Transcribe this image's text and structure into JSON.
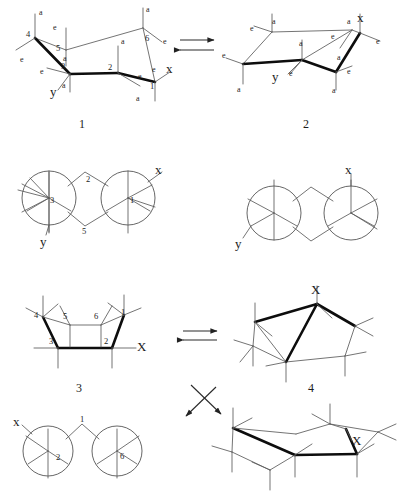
{
  "figure": {
    "background": "#ffffff",
    "ink": "#1c1c1c",
    "bold_bond_color": "#000000",
    "thin_bond_color": "#555555"
  },
  "captions": {
    "structure_1": "1",
    "structure_2": "2",
    "structure_3": "3",
    "structure_4": "4"
  },
  "arrows": {
    "equilibrium_top": "⇌",
    "equilibrium_middle": "⇌",
    "equilibrium_diagonal": "⇌"
  },
  "structure_1": {
    "caption": "1",
    "type": "chair-conformation",
    "ring_numbers": [
      "4",
      "5",
      "3",
      "2",
      "6",
      "1"
    ],
    "substituent_labels": [
      {
        "text": "a",
        "x": 39,
        "y": 9
      },
      {
        "text": "e",
        "x": 53,
        "y": 24
      },
      {
        "text": "e",
        "x": 20,
        "y": 56
      },
      {
        "text": "a",
        "x": 63,
        "y": 55
      },
      {
        "text": "e",
        "x": 46,
        "y": 72
      },
      {
        "text": "a",
        "x": 62,
        "y": 82
      },
      {
        "text": "a",
        "x": 146,
        "y": 10
      },
      {
        "text": "e",
        "x": 163,
        "y": 36
      },
      {
        "text": "a",
        "x": 121,
        "y": 40
      },
      {
        "text": "e",
        "x": 139,
        "y": 77
      },
      {
        "text": "e",
        "x": 152,
        "y": 69
      },
      {
        "text": "a",
        "x": 135,
        "y": 97
      }
    ],
    "position_numbers": [
      {
        "text": "4",
        "x": 27,
        "y": 32
      },
      {
        "text": "5",
        "x": 50,
        "y": 42
      },
      {
        "text": "3",
        "x": 60,
        "y": 62
      },
      {
        "text": "2",
        "x": 105,
        "y": 66
      },
      {
        "text": "6",
        "x": 146,
        "y": 36
      },
      {
        "text": "1",
        "x": 152,
        "y": 83
      }
    ],
    "groups": [
      {
        "text": "y",
        "x": 49,
        "y": 86
      },
      {
        "text": "x",
        "x": 163,
        "y": 65
      }
    ]
  },
  "structure_2": {
    "caption": "2",
    "type": "chair-conformation-flipped",
    "substituent_labels": [
      {
        "text": "a",
        "x": 276,
        "y": 21
      },
      {
        "text": "e",
        "x": 256,
        "y": 30
      },
      {
        "text": "e",
        "x": 231,
        "y": 57
      },
      {
        "text": "a",
        "x": 228,
        "y": 84
      },
      {
        "text": "a",
        "x": 297,
        "y": 50
      },
      {
        "text": "e",
        "x": 293,
        "y": 68
      },
      {
        "text": "e",
        "x": 330,
        "y": 35
      },
      {
        "text": "a",
        "x": 337,
        "y": 53
      },
      {
        "text": "a",
        "x": 348,
        "y": 22
      },
      {
        "text": "e",
        "x": 371,
        "y": 39
      },
      {
        "text": "e",
        "x": 347,
        "y": 70
      },
      {
        "text": "a",
        "x": 336,
        "y": 86
      }
    ],
    "groups": [
      {
        "text": "x",
        "x": 357,
        "y": 14
      },
      {
        "text": "y",
        "x": 275,
        "y": 72
      }
    ]
  },
  "newman_1": {
    "type": "newman-projection",
    "position_numbers": [
      {
        "text": "3",
        "x": 52,
        "y": 195
      },
      {
        "text": "1",
        "x": 131,
        "y": 195
      },
      {
        "text": "2",
        "x": 89,
        "y": 180
      },
      {
        "text": "5",
        "x": 85,
        "y": 230
      }
    ],
    "groups": [
      {
        "text": "x",
        "x": 156,
        "y": 168
      },
      {
        "text": "y",
        "x": 44,
        "y": 238
      }
    ]
  },
  "newman_2": {
    "type": "newman-projection",
    "groups": [
      {
        "text": "x",
        "x": 345,
        "y": 170
      },
      {
        "text": "y",
        "x": 238,
        "y": 243
      }
    ]
  },
  "structure_3": {
    "caption": "3",
    "type": "boat-conformation",
    "position_numbers": [
      {
        "text": "4",
        "x": 35,
        "y": 313
      },
      {
        "text": "5",
        "x": 64,
        "y": 315
      },
      {
        "text": "6",
        "x": 95,
        "y": 315
      },
      {
        "text": "1",
        "x": 122,
        "y": 311
      },
      {
        "text": "3",
        "x": 50,
        "y": 341
      },
      {
        "text": "2",
        "x": 106,
        "y": 341
      }
    ],
    "groups": [
      {
        "text": "X",
        "x": 128,
        "y": 347
      }
    ]
  },
  "structure_4": {
    "caption": "4",
    "type": "twist-boat-conformation",
    "groups": [
      {
        "text": "X",
        "x": 312,
        "y": 291
      }
    ]
  },
  "newman_3": {
    "type": "newman-projection",
    "position_numbers": [
      {
        "text": "1",
        "x": 82,
        "y": 419
      },
      {
        "text": "2",
        "x": 58,
        "y": 457
      },
      {
        "text": "6",
        "x": 122,
        "y": 456
      }
    ],
    "groups": [
      {
        "text": "x",
        "x": 19,
        "y": 423
      }
    ]
  },
  "structure_5": {
    "type": "twist-boat-conformation",
    "groups": [
      {
        "text": "X",
        "x": 353,
        "y": 442
      }
    ]
  }
}
